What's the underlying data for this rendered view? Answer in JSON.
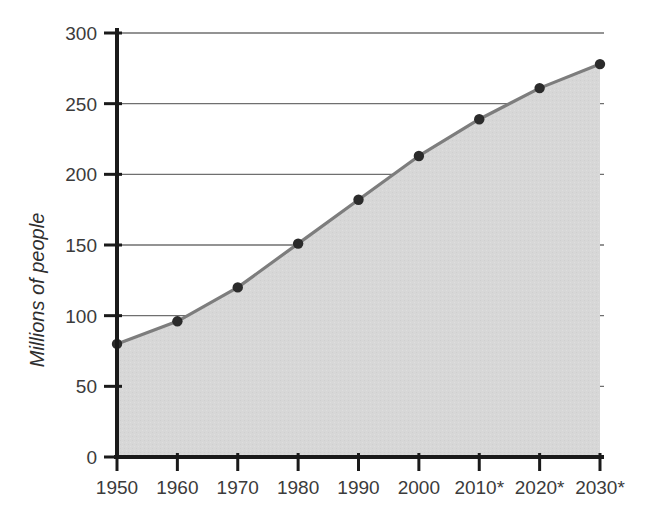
{
  "chart_data": {
    "type": "area",
    "title": "",
    "subtitle": "",
    "xlabel": "",
    "ylabel": "Millions of people",
    "categories": [
      "1950",
      "1960",
      "1970",
      "1980",
      "1990",
      "2000",
      "2010*",
      "2020*",
      "2030*"
    ],
    "x_values": [
      1950,
      1960,
      1970,
      1980,
      1990,
      2000,
      2010,
      2020,
      2030
    ],
    "values": [
      80,
      96,
      120,
      151,
      182,
      213,
      239,
      261,
      278
    ],
    "series": [
      {
        "name": "Population",
        "values": [
          80,
          96,
          120,
          151,
          182,
          213,
          239,
          261,
          278
        ]
      }
    ],
    "ylim": [
      0,
      300
    ],
    "ytick_labels": [
      "0",
      "50",
      "100",
      "150",
      "200",
      "250",
      "300"
    ],
    "ytick_values": [
      0,
      50,
      100,
      150,
      200,
      250,
      300
    ],
    "grid": true,
    "grid_axis": "y",
    "legend": false,
    "legend_position": "none",
    "markers": true,
    "annotations": [],
    "colors": {
      "area_fill": "#d6d6d6",
      "line": "#7d7d7d",
      "marker": "#2b2b2b",
      "grid": "#6f6f6f",
      "axis": "#1a1a1a",
      "text": "#3b3b3b",
      "background": "#ffffff"
    }
  }
}
